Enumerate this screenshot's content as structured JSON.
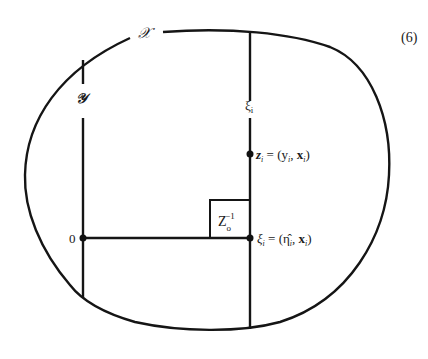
{
  "equation_number": "(6)",
  "labels": {
    "set_X": "𝒳",
    "set_Y": "𝒴",
    "xi_line": "ξ",
    "xi_line_sub": "i",
    "origin": "0",
    "box_main": "Z",
    "box_sub": "o",
    "box_sup": "−1",
    "z_point": "z",
    "z_point_sub": "i",
    "z_point_rhs": " = (y",
    "z_point_rhs_sub": "i",
    "z_point_rhs_tail": ", ",
    "z_point_bold": "x",
    "z_point_bold_sub": "i",
    "z_point_close": ")",
    "xi_point": "ξ",
    "xi_point_sub": "i",
    "xi_point_rhs": " = (η̂",
    "xi_point_rhs_sub": "i",
    "xi_point_rhs_tail": ", ",
    "xi_point_bold": "x",
    "xi_point_bold_sub": "i",
    "xi_point_close": ")"
  },
  "colors": {
    "stroke": "#151515",
    "background": "#ffffff"
  }
}
